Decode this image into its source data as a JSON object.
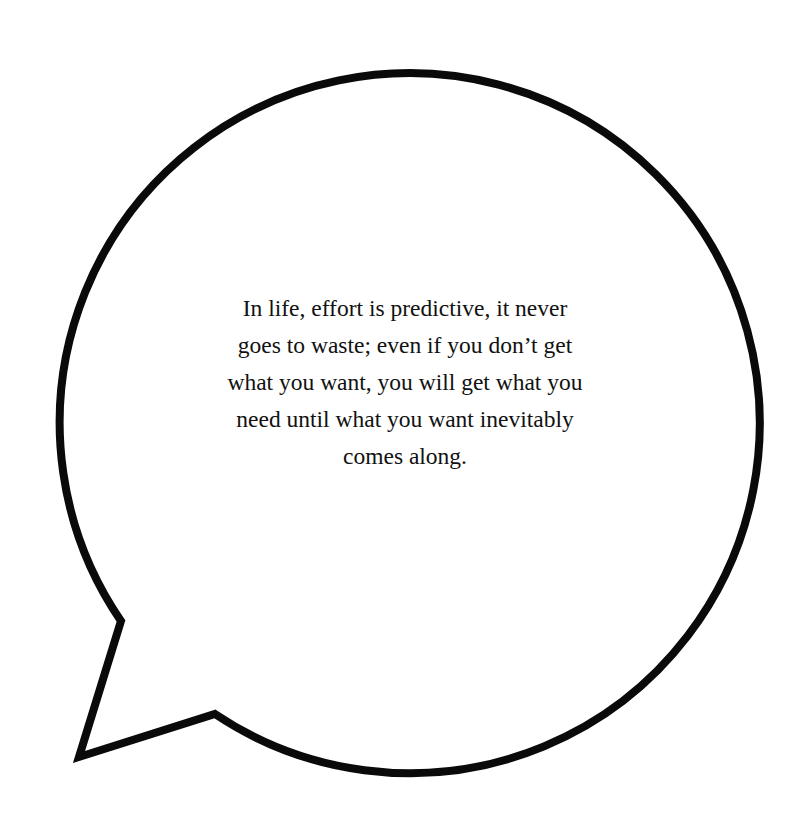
{
  "bubble": {
    "stroke_color": "#0a0a0a",
    "fill_color": "#ffffff",
    "shape": "speech-bubble-circle-tail-bottom-left"
  },
  "quote": {
    "lines": [
      "In life, effort is predictive, it never",
      "goes to waste; even if you don’t get",
      "what you want, you will get what you",
      "need until what you want inevitably",
      "comes along."
    ]
  }
}
